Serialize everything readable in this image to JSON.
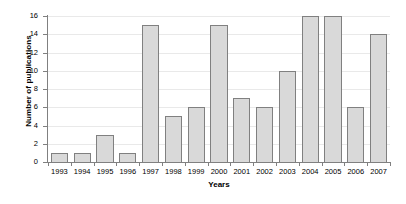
{
  "chart_data": {
    "type": "bar",
    "title": "",
    "xlabel": "Years",
    "ylabel": "Number of publications",
    "categories": [
      "1993",
      "1994",
      "1995",
      "1996",
      "1997",
      "1998",
      "1999",
      "2000",
      "2001",
      "2002",
      "2003",
      "2004",
      "2005",
      "2006",
      "2007"
    ],
    "values": [
      1,
      1,
      3,
      1,
      15,
      5,
      6,
      15,
      7,
      6,
      10,
      16,
      16,
      6,
      14
    ],
    "ylim": [
      0,
      16
    ],
    "y_ticks": [
      "0",
      "2",
      "4",
      "6",
      "8",
      "10",
      "12",
      "14",
      "16"
    ],
    "y_tick_values": [
      0,
      2,
      4,
      6,
      8,
      10,
      12,
      14,
      16
    ],
    "grid": true,
    "grid_axis": "y",
    "legend": "none",
    "bar_fill_color": "#d9d9d9",
    "bar_border_color": "#808080",
    "gridline_color": "#e9e9e9",
    "axis_color": "#808080",
    "background_color": "#ffffff"
  }
}
